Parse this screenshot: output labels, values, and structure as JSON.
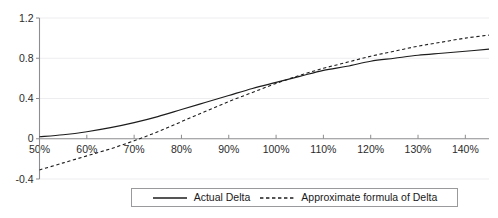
{
  "chart_data": {
    "type": "line",
    "title": "",
    "xlabel": "",
    "ylabel": "",
    "xlim": [
      50,
      145
    ],
    "ylim": [
      -0.4,
      1.2
    ],
    "grid": true,
    "x_tick_labels": [
      "50%",
      "60%",
      "70%",
      "80%",
      "90%",
      "100%",
      "110%",
      "120%",
      "130%",
      "140%"
    ],
    "x_tick_values": [
      50,
      60,
      70,
      80,
      90,
      100,
      110,
      120,
      130,
      140
    ],
    "y_tick_labels": [
      "1.2",
      "0.8",
      "0.4",
      "0",
      "-0.4"
    ],
    "y_tick_values": [
      1.2,
      0.8,
      0.4,
      0,
      -0.4
    ],
    "legend_position": "bottom-center",
    "x": [
      50,
      55,
      60,
      65,
      70,
      75,
      80,
      85,
      90,
      95,
      100,
      105,
      110,
      115,
      120,
      125,
      130,
      135,
      140,
      145
    ],
    "series": [
      {
        "name": "Actual Delta",
        "style": "solid",
        "color": "#1c1c1c",
        "values": [
          0.02,
          0.04,
          0.07,
          0.11,
          0.16,
          0.22,
          0.29,
          0.36,
          0.43,
          0.5,
          0.56,
          0.62,
          0.68,
          0.72,
          0.77,
          0.8,
          0.83,
          0.85,
          0.87,
          0.89
        ]
      },
      {
        "name": "Approximate formula of Delta",
        "style": "dashed",
        "color": "#1c1c1c",
        "values": [
          -0.31,
          -0.24,
          -0.17,
          -0.1,
          -0.02,
          0.07,
          0.17,
          0.27,
          0.37,
          0.46,
          0.55,
          0.63,
          0.7,
          0.76,
          0.82,
          0.87,
          0.92,
          0.96,
          1.0,
          1.03
        ]
      }
    ]
  },
  "legend": {
    "entries": [
      {
        "label": "Actual Delta",
        "style": "solid"
      },
      {
        "label": "Approximate formula of Delta",
        "style": "dashed"
      }
    ]
  },
  "caption": {
    "text": ""
  }
}
